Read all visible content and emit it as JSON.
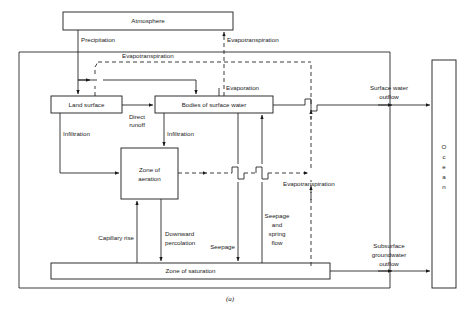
{
  "figure": {
    "caption": "(a)",
    "type": "block-flow-diagram"
  },
  "boxes": {
    "atmosphere": {
      "label": "Atmosphere",
      "x": 63,
      "y": 12,
      "w": 170,
      "h": 18
    },
    "land_surface": {
      "label": "Land surface",
      "x": 51,
      "y": 96,
      "w": 71,
      "h": 17
    },
    "surface_water": {
      "label": "Bodies of surface water",
      "x": 155,
      "y": 96,
      "w": 118,
      "h": 17
    },
    "zone_aeration": {
      "label_line1": "Zone of",
      "label_line2": "aeration",
      "x": 121,
      "y": 148,
      "w": 57,
      "h": 51
    },
    "zone_saturation": {
      "label": "Zone of saturation",
      "x": 51,
      "y": 263,
      "w": 279,
      "h": 16
    },
    "ocean": {
      "letters": [
        "O",
        "c",
        "e",
        "a",
        "n"
      ],
      "x": 432,
      "y": 60,
      "w": 24,
      "h": 228
    }
  },
  "flows": {
    "precipitation": {
      "label": "Precipitation"
    },
    "evapotranspiration_top": {
      "label": "Evapotranspiration"
    },
    "evapotranspiration_land": {
      "label": "Evapotranspiration"
    },
    "evapotranspiration_sub": {
      "label": "Evapotranspiration"
    },
    "evaporation": {
      "label": "Evaporation"
    },
    "direct_runoff": {
      "label_line1": "Direct",
      "label_line2": "runoff"
    },
    "infiltration_left": {
      "label": "Infiltration"
    },
    "infiltration_right": {
      "label": "Infiltration"
    },
    "capillary_rise": {
      "label": "Capillary rise"
    },
    "downward_percolation": {
      "label_line1": "Downward",
      "label_line2": "percolation"
    },
    "seepage": {
      "label": "Seepage"
    },
    "seepage_spring_flow": {
      "label_line1": "Seepage",
      "label_line2": "and",
      "label_line3": "spring",
      "label_line4": "flow"
    },
    "surface_water_outflow": {
      "label_line1": "Surface water",
      "label_line2": "outflow"
    },
    "subsurface_groundwater_outflow": {
      "label_line1": "Subsurface",
      "label_line2": "groundwater",
      "label_line3": "outflow"
    }
  },
  "colors": {
    "stroke": "#1a1a1a",
    "background": "#ffffff",
    "box_fill": "#ffffff"
  }
}
